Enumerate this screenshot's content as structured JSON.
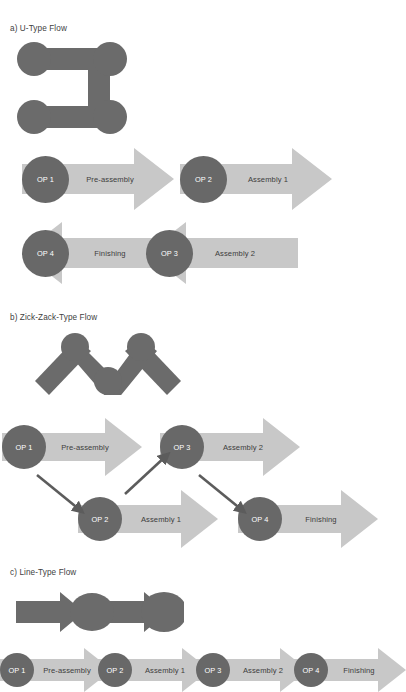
{
  "figure": {
    "type": "diagram",
    "colors": {
      "station_circle": "#686868",
      "process_arrow": "#c8c8c8",
      "icon_gray": "#6b6b6b",
      "connector_arrow": "#5c5c5c",
      "background": "#ffffff",
      "circle_text": "#ffffff",
      "arrow_text": "#3d3d3d"
    }
  },
  "sections": [
    {
      "id": "u-type",
      "title": "a) U-Type Flow",
      "icon": "u-shape-layout-icon",
      "rows": [
        {
          "direction": "right",
          "stages": [
            {
              "station": "OP 1",
              "process": "Pre-assembly"
            },
            {
              "station": "OP 2",
              "process": "Assembly 1"
            }
          ]
        },
        {
          "direction": "left",
          "stages": [
            {
              "station": "OP 4",
              "process": "Finishing"
            },
            {
              "station": "OP 3",
              "process": "Assembly 2"
            }
          ]
        }
      ]
    },
    {
      "id": "zick-zack-type",
      "title": "b) Zick-Zack-Type Flow",
      "icon": "zigzag-layout-icon",
      "stages": [
        {
          "station": "OP 1",
          "process": "Pre-assembly"
        },
        {
          "station": "OP 2",
          "process": "Assembly 1"
        },
        {
          "station": "OP 3",
          "process": "Assembly 2"
        },
        {
          "station": "OP 4",
          "process": "Finishing"
        }
      ],
      "connectors": [
        {
          "from": "OP 1",
          "to": "OP 2"
        },
        {
          "from": "OP 2",
          "to": "OP 3"
        },
        {
          "from": "OP 3",
          "to": "OP 4"
        }
      ]
    },
    {
      "id": "line-type",
      "title": "c) Line-Type Flow",
      "icon": "line-layout-icon",
      "stages": [
        {
          "station": "OP 1",
          "process": "Pre-assembly"
        },
        {
          "station": "OP 2",
          "process": "Assembly 1"
        },
        {
          "station": "OP 3",
          "process": "Assembly 2"
        },
        {
          "station": "OP 4",
          "process": "Finishing"
        }
      ]
    }
  ]
}
